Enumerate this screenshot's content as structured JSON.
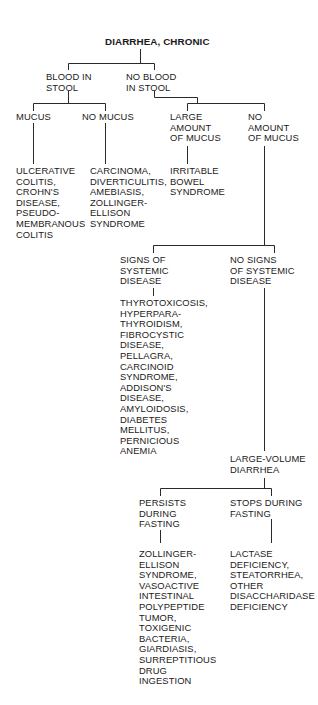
{
  "diagram": {
    "title": "DIARRHEA, CHRONIC",
    "blood_in_stool": {
      "lines": [
        "BLOOD IN",
        "STOOL"
      ]
    },
    "no_blood_in_stool": {
      "lines": [
        "NO BLOOD",
        "IN STOOL"
      ]
    },
    "mucus": {
      "lines": [
        "MUCUS"
      ]
    },
    "no_mucus": {
      "lines": [
        "NO MUCUS"
      ]
    },
    "large_amount_of_mucus": {
      "lines": [
        "LARGE",
        "AMOUNT",
        "OF MUCUS"
      ]
    },
    "no_amount_of_mucus": {
      "lines": [
        "NO",
        "AMOUNT",
        "OF MUCUS"
      ]
    },
    "mucus_diagnoses": {
      "lines": [
        "ULCERATIVE",
        "COLITIS,",
        "CROHN'S",
        "DISEASE,",
        "PSEUDO-",
        "MEMBRANOUS",
        "COLITIS"
      ]
    },
    "no_mucus_diagnoses": {
      "lines": [
        "CARCINOMA,",
        "DIVERTICULITIS,",
        "AMEBIASIS,",
        "ZOLLINGER-",
        "ELLISON",
        "SYNDROME"
      ]
    },
    "large_mucus_diagnoses": {
      "lines": [
        "IRRITABLE",
        "BOWEL",
        "SYNDROME"
      ]
    },
    "signs_of_systemic_disease": {
      "lines": [
        "SIGNS OF",
        "SYSTEMIC",
        "DISEASE"
      ]
    },
    "no_signs_of_systemic_disease": {
      "lines": [
        "NO SIGNS",
        "OF SYSTEMIC",
        "DISEASE"
      ]
    },
    "systemic_diagnoses": {
      "lines": [
        "THYROTOXICOSIS,",
        "HYPERPARA-",
        "THYROIDISM,",
        "FIBROCYSTIC",
        "DISEASE,",
        "PELLAGRA,",
        "CARCINOID",
        "SYNDROME,",
        "ADDISON'S",
        "DISEASE,",
        "AMYLOIDOSIS,",
        "DIABETES",
        "MELLITUS,",
        "PERNICIOUS",
        "ANEMIA"
      ]
    },
    "large_volume_diarrhea": {
      "lines": [
        "LARGE-VOLUME",
        "DIARRHEA"
      ]
    },
    "persists_during_fasting": {
      "lines": [
        "PERSISTS",
        "DURING",
        "FASTING"
      ]
    },
    "stops_during_fasting": {
      "lines": [
        "STOPS DURING",
        "FASTING"
      ]
    },
    "persists_diagnoses": {
      "lines": [
        "ZOLLINGER-",
        "ELLISON",
        "SYNDROME,",
        "VASOACTIVE",
        "INTESTINAL",
        "POLYPEPTIDE",
        "TUMOR,",
        "TOXIGENIC",
        "BACTERIA,",
        "GIARDIASIS,",
        "SURREPTITIOUS",
        "DRUG",
        "INGESTION"
      ]
    },
    "stops_diagnoses": {
      "lines": [
        "LACTASE",
        "DEFICIENCY,",
        "STEATORRHEA,",
        "OTHER",
        "DISACCHARIDASE",
        "DEFICIENCY"
      ]
    }
  },
  "colors": {
    "text": "#1a1a1a",
    "line": "#2a2a2a",
    "background": "#ffffff"
  }
}
